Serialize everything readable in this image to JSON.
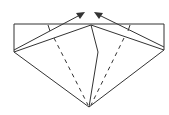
{
  "diagram": {
    "type": "origami-fold-step",
    "stroke_color": "#333333",
    "background_color": "#ffffff",
    "outline": {
      "rect_top_left": [
        14,
        24
      ],
      "rect_top_right": [
        164,
        24
      ],
      "rect_bottom_left": [
        14,
        52
      ],
      "rect_bottom_right": [
        164,
        50
      ],
      "center_top": [
        91,
        25
      ],
      "center_kink": [
        98,
        52
      ],
      "bottom_apex": [
        89,
        107
      ]
    },
    "flaps": {
      "left_flap_outer": [
        [
          14,
          52
        ],
        [
          91,
          25
        ]
      ],
      "left_flap_inner": [
        [
          14,
          48
        ],
        [
          70,
          22
        ]
      ],
      "right_flap_outer": [
        [
          164,
          50
        ],
        [
          91,
          25
        ]
      ],
      "right_flap_inner": [
        [
          164,
          47
        ],
        [
          108,
          22
        ]
      ]
    },
    "valley_folds": [
      {
        "from": [
          48,
          25
        ],
        "to": [
          88,
          105
        ]
      },
      {
        "from": [
          130,
          25
        ],
        "to": [
          92,
          105
        ]
      }
    ],
    "arrows": [
      {
        "name": "left-fold-arrow",
        "from": [
          14,
          50
        ],
        "to": [
          84,
          13
        ]
      },
      {
        "name": "right-fold-arrow",
        "from": [
          164,
          48
        ],
        "to": [
          95,
          13
        ]
      }
    ]
  }
}
